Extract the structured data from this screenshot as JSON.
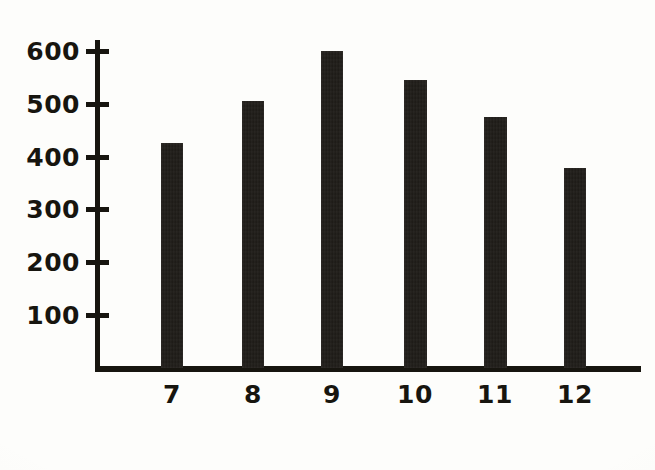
{
  "chart_data": {
    "type": "bar",
    "title": "",
    "subtitle": "",
    "xlabel": "",
    "ylabel": "",
    "categories": [
      "7",
      "8",
      "9",
      "10",
      "11",
      "12"
    ],
    "values": [
      425,
      505,
      600,
      545,
      475,
      378
    ],
    "series": [
      {
        "name": "",
        "values": [
          425,
          505,
          600,
          545,
          475,
          378
        ]
      }
    ],
    "ylim": [
      0,
      630
    ],
    "xlim_categories": 6,
    "y_ticks": [
      100,
      200,
      300,
      400,
      500,
      600
    ],
    "y_tick_labels": [
      "100",
      "200",
      "300",
      "400",
      "500",
      "600"
    ],
    "x_tick_labels": [
      "7",
      "8",
      "9",
      "10",
      "11",
      "12"
    ],
    "grid": false,
    "legend": false,
    "legend_position": "none",
    "annotations": [],
    "colors": {
      "bar": "#1b1814",
      "axis": "#17150f",
      "text": "#17150f",
      "background": "#fdfdfb"
    },
    "style_notes": "scanned black-and-white photocopy, hand-lettered numerals, no gridlines, no axis titles"
  },
  "axis": {
    "y_axis_name": "y-axis",
    "x_axis_name": "x-axis"
  }
}
